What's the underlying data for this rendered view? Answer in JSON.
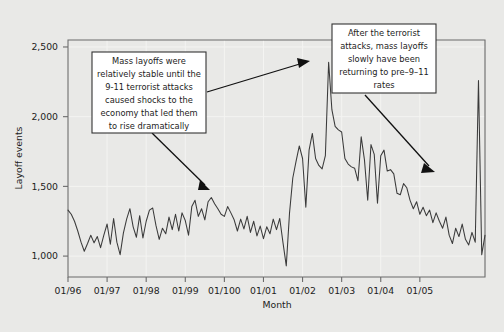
{
  "chart_data": {
    "type": "line",
    "title": "",
    "xlabel": "Month",
    "ylabel": "Layoff events",
    "ylim": [
      850,
      2550
    ],
    "yticks": [
      1000,
      1500,
      2000,
      2500
    ],
    "ytick_labels": [
      "1,000",
      "1,500",
      "2,000",
      "2,500"
    ],
    "xtick_labels": [
      "01/96",
      "01/97",
      "01/98",
      "01/99",
      "01/100",
      "01/01",
      "01/02",
      "01/03",
      "01/04",
      "01/05"
    ],
    "grid": "faint white gridlines at major ticks",
    "legend": "none",
    "series": [
      {
        "name": "Layoff events",
        "values": [
          1330,
          1300,
          1250,
          1180,
          1100,
          1035,
          1090,
          1150,
          1095,
          1140,
          1060,
          1150,
          1230,
          1085,
          1270,
          1100,
          1010,
          1165,
          1265,
          1340,
          1210,
          1135,
          1290,
          1130,
          1250,
          1330,
          1345,
          1220,
          1120,
          1200,
          1160,
          1280,
          1190,
          1300,
          1180,
          1310,
          1255,
          1150,
          1355,
          1400,
          1285,
          1340,
          1260,
          1390,
          1420,
          1375,
          1340,
          1300,
          1285,
          1355,
          1310,
          1260,
          1180,
          1265,
          1195,
          1285,
          1170,
          1250,
          1145,
          1215,
          1125,
          1210,
          1160,
          1265,
          1190,
          1270,
          1095,
          930,
          1310,
          1560,
          1680,
          1790,
          1700,
          1350,
          1760,
          1880,
          1700,
          1650,
          1625,
          1720,
          2390,
          2050,
          1930,
          1905,
          1890,
          1700,
          1660,
          1640,
          1630,
          1540,
          1855,
          1690,
          1400,
          1800,
          1730,
          1380,
          1720,
          1760,
          1610,
          1620,
          1590,
          1450,
          1440,
          1520,
          1490,
          1400,
          1340,
          1390,
          1300,
          1350,
          1290,
          1330,
          1240,
          1310,
          1250,
          1200,
          1280,
          1150,
          1090,
          1200,
          1140,
          1230,
          1120,
          1080,
          1170,
          1100,
          2260,
          1010,
          1150
        ]
      }
    ],
    "annotations": [
      {
        "id": "left-annotation",
        "lines": [
          "Mass layoffs were",
          "relatively stable until the",
          "9-11 terrorist attacks",
          "caused shocks to the",
          "economy that led them",
          "to rise dramatically"
        ]
      },
      {
        "id": "right-annotation",
        "lines": [
          "After the terrorist",
          "attacks, mass layoffs",
          "slowly have been",
          "returning to pre–9–11",
          "rates"
        ]
      }
    ],
    "colors": {
      "background": "#e9e9e7",
      "line": "#3a3a3a",
      "axis": "#6b6b6b",
      "grid": "#f4f4f2",
      "annotation_bg": "#ffffff",
      "annotation_border": "#333333"
    }
  }
}
